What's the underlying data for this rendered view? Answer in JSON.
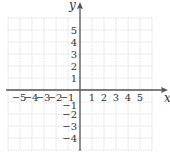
{
  "chart_data": {
    "type": "coordinate-grid",
    "title": "",
    "xlabel": "x",
    "ylabel": "y",
    "xlim": [
      -6,
      6
    ],
    "ylim": [
      -5,
      6
    ],
    "grid": true,
    "x_ticks": [
      -5,
      -4,
      -3,
      -2,
      -1,
      1,
      2,
      3,
      4,
      5
    ],
    "y_ticks": [
      -4,
      -3,
      -2,
      -1,
      1,
      2,
      3,
      4,
      5
    ],
    "x_tick_labels": [
      "−5",
      "−4",
      "−3",
      "−2",
      "−1",
      "1",
      "2",
      "3",
      "4",
      "5"
    ],
    "y_tick_labels": [
      "−4",
      "−3",
      "−2",
      "−1",
      "1",
      "2",
      "3",
      "4",
      "5"
    ],
    "series": []
  },
  "colors": {
    "grid": "#d8d8d8",
    "axis": "#555555",
    "text": "#333333"
  },
  "layout": {
    "origin_px": [
      80,
      90
    ],
    "unit_px": 12
  }
}
